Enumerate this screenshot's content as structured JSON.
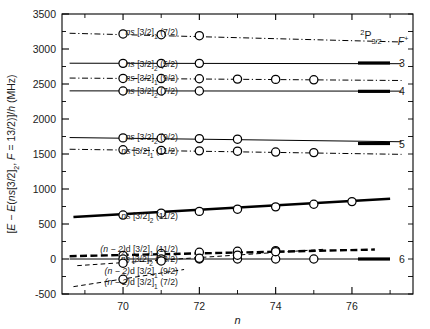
{
  "figure": {
    "background": "#ffffff",
    "axis_color": "#000000"
  },
  "axes": {
    "x": {
      "label": "n",
      "min": 68.4,
      "max": 77.6,
      "major_ticks": [
        70,
        72,
        74,
        76
      ],
      "major_tick_labels": [
        "70",
        "72",
        "74",
        "76"
      ],
      "minor_ticks": [
        69,
        71,
        73,
        75,
        77
      ]
    },
    "y": {
      "label_parts": {
        "prefix": "[E − E(",
        "italic_ns": "ns",
        "bracket": "[3/2]",
        "sub1": "2",
        "mid": ", ",
        "italic_F": "F",
        "eq": " = 13/2)]/",
        "italic_h": "h",
        "unit": " (MHz)"
      },
      "label_text": "[E − E(ns[3/2]2, F = 13/2)]/h (MHz)",
      "min": -500,
      "max": 3500,
      "major_ticks": [
        -500,
        0,
        500,
        1000,
        1500,
        2000,
        2500,
        3000,
        3500
      ],
      "major_tick_labels": [
        "-500",
        "0",
        "500",
        "1000",
        "1500",
        "2000",
        "2500",
        "3000",
        "3500"
      ],
      "minor_ticks": [
        -250,
        250,
        750,
        1250,
        1750,
        2250,
        2750,
        3250
      ],
      "unit": "MHz"
    }
  },
  "ion_core_legend": {
    "title_sup": "2",
    "title_main": "P",
    "title_sub": "3/2",
    "title_text": "2P3/2",
    "column_header": "F",
    "column_header_sup": "+",
    "column_header_text": "F+",
    "levels": [
      {
        "label": "3",
        "energy": 2800
      },
      {
        "label": "4",
        "energy": 2395
      },
      {
        "label": "5",
        "energy": 1650
      },
      {
        "label": "6",
        "energy": 0
      }
    ]
  },
  "chart_data": {
    "type": "line",
    "title": "",
    "xlabel": "n",
    "ylabel": "[E − E(ns[3/2]2, F = 13/2)]/h (MHz)",
    "xlim": [
      68.4,
      77.6
    ],
    "ylim": [
      -500,
      3500
    ],
    "grid": false,
    "legend": "inline-left-labels",
    "marker": "open-circle",
    "series": [
      {
        "name": "ns [3/2]1 (7/2)",
        "label_parts": {
          "italic": "ns",
          "term": " [3/2]",
          "sub": "1",
          "f": " (7/2)"
        },
        "linestyle": "dashdot",
        "linewidth": 1.0,
        "label_y": 3240,
        "x": [
          70.0,
          71.0,
          72.0
        ],
        "y": [
          3215,
          3205,
          3190
        ],
        "line_x": [
          68.6,
          77.3
        ],
        "line_y": [
          3225,
          3100
        ]
      },
      {
        "name": "ns [3/2]2 (5/2)",
        "label_parts": {
          "italic": "ns",
          "term": " [3/2]",
          "sub": "2",
          "f": " (5/2)"
        },
        "linestyle": "solid",
        "linewidth": 1.0,
        "label_y": 2795,
        "x": [
          70.0,
          71.0,
          72.0
        ],
        "y": [
          2795,
          2795,
          2795
        ],
        "line_x": [
          68.6,
          77.3
        ],
        "line_y": [
          2797,
          2790
        ]
      },
      {
        "name": "ns [3/2]1 (9/2)",
        "label_parts": {
          "italic": "ns",
          "term": " [3/2]",
          "sub": "1",
          "f": " (9/2)"
        },
        "linestyle": "dashdot",
        "linewidth": 1.0,
        "label_y": 2585,
        "x": [
          70.0,
          71.0,
          72.0,
          73.0,
          74.0,
          75.0
        ],
        "y": [
          2580,
          2578,
          2575,
          2570,
          2566,
          2560
        ],
        "line_x": [
          68.6,
          77.3
        ],
        "line_y": [
          2585,
          2550
        ]
      },
      {
        "name": "ns [3/2]2 (7/2)",
        "label_parts": {
          "italic": "ns",
          "term": " [3/2]",
          "sub": "2",
          "f": " (7/2)"
        },
        "linestyle": "solid",
        "linewidth": 1.0,
        "label_y": 2400,
        "x": [
          70.0,
          71.0,
          72.0
        ],
        "y": [
          2400,
          2400,
          2400
        ],
        "line_x": [
          68.6,
          77.3
        ],
        "line_y": [
          2402,
          2398
        ]
      },
      {
        "name": "ns [3/2]2 (9/2)",
        "label_parts": {
          "italic": "ns",
          "term": " [3/2]",
          "sub": "2",
          "f": " (9/2)"
        },
        "linestyle": "solid",
        "linewidth": 1.0,
        "label_y": 1745,
        "x": [
          70.0,
          71.0,
          72.0,
          73.0
        ],
        "y": [
          1730,
          1725,
          1720,
          1712
        ],
        "line_x": [
          68.6,
          77.3
        ],
        "line_y": [
          1735,
          1675
        ]
      },
      {
        "name": "ns [3/2]1 (11/2)",
        "label_parts": {
          "italic": "ns",
          "term": " [3/2]",
          "sub": "1",
          "f": " (11/2)"
        },
        "linestyle": "dashdot",
        "linewidth": 1.0,
        "label_y": 1540,
        "x": [
          70.0,
          71.0,
          72.0,
          73.0,
          74.0,
          75.0
        ],
        "y": [
          1560,
          1552,
          1545,
          1540,
          1528,
          1520
        ],
        "line_x": [
          68.6,
          77.3
        ],
        "line_y": [
          1568,
          1495
        ]
      },
      {
        "name": "ns [3/2]2 (11/2)",
        "label_parts": {
          "italic": "ns",
          "term": " [3/2]",
          "sub": "2",
          "f": " (11/2)"
        },
        "linestyle": "solid",
        "linewidth": 2.6,
        "label_y": 615,
        "x": [
          70.0,
          71.0,
          72.0,
          73.0,
          74.0,
          75.0,
          76.0
        ],
        "y": [
          628,
          655,
          680,
          712,
          745,
          782,
          820
        ],
        "line_x": [
          68.7,
          77.0
        ],
        "line_y": [
          600,
          860
        ]
      },
      {
        "name": "(n − 2)d [3/2]1 (11/2)",
        "label_parts": {
          "italic": "(n − 2)",
          "term": "d [3/2]",
          "sub": "1",
          "f": " (11/2)"
        },
        "linestyle": "dashed",
        "linewidth": 2.4,
        "label_y": 150,
        "x": [
          70.0,
          71.0,
          72.0,
          73.0,
          74.0
        ],
        "y": [
          52,
          78,
          96,
          110,
          120
        ],
        "line_x": [
          68.6,
          76.6
        ],
        "line_y": [
          40,
          135
        ]
      },
      {
        "name": "ns [3/2]2 (13/2)",
        "label_parts": {
          "italic": "ns",
          "term": " [3/2]",
          "sub": "2",
          "f": " (13/2)"
        },
        "linestyle": "solid",
        "linewidth": 1.0,
        "label_y": 10,
        "x": [
          70.0,
          71.0,
          72.0,
          73.0,
          74.0,
          75.0
        ],
        "y": [
          0,
          0,
          0,
          0,
          0,
          0
        ],
        "line_x": [
          68.6,
          76.7
        ],
        "line_y": [
          0,
          0
        ]
      },
      {
        "name": "(n − 2)d [3/2]1 (9/2)",
        "label_parts": {
          "italic": "(n − 2)",
          "term": "d [3/2]",
          "sub": "1",
          "f": " (9/2)"
        },
        "linestyle": "dashed",
        "linewidth": 1.0,
        "label_y": -170,
        "x": [
          70.0,
          71.0,
          72.0,
          73.0,
          74.0
        ],
        "y": [
          -60,
          -28,
          10,
          55,
          105
        ],
        "line_x": [
          68.8,
          75.3
        ],
        "line_y": [
          -95,
          140
        ]
      },
      {
        "name": "(n − 2)d [3/2]1 (7/2)",
        "label_parts": {
          "italic": "(n − 2)",
          "term": "d [3/2]",
          "sub": "1",
          "f": " (7/2)"
        },
        "linestyle": "dashed",
        "linewidth": 1.0,
        "label_y": -320,
        "x": [
          70.0
        ],
        "y": [
          -290
        ],
        "line_x": [
          68.7,
          71.6
        ],
        "line_y": [
          -395,
          -150
        ]
      }
    ]
  }
}
